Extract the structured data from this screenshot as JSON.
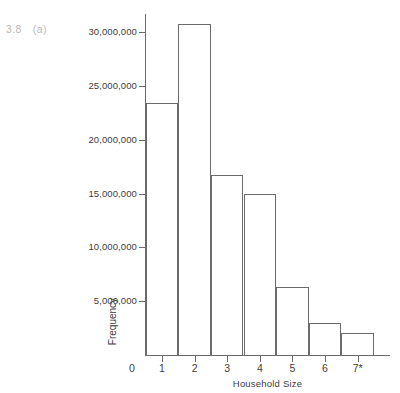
{
  "figure": {
    "number": "3.8",
    "part": "(a)",
    "top_bleed_text": ""
  },
  "chart_data": {
    "type": "bar",
    "title": "",
    "subtitle": "",
    "xlabel": "Household Size",
    "ylabel": "Frequency",
    "categories": [
      "1",
      "2",
      "3",
      "4",
      "5",
      "6",
      "7*"
    ],
    "values": [
      23400000,
      30700000,
      16700000,
      15000000,
      6300000,
      3000000,
      2000000
    ],
    "x_tick_labels": [
      "0",
      "1",
      "2",
      "3",
      "4",
      "5",
      "6",
      "7*"
    ],
    "y_tick_labels": [
      "5,000,000",
      "10,000,000",
      "15,000,000",
      "20,000,000",
      "25,000,000",
      "30,000,000"
    ],
    "y_tick_values": [
      5000000,
      10000000,
      15000000,
      20000000,
      25000000,
      30000000
    ],
    "ylim": [
      0,
      31600000
    ],
    "xlim": [
      0,
      7.5
    ],
    "grid": false,
    "legend": false,
    "bar_style": "outline",
    "colors": {
      "stroke": "#6b6b6b",
      "fill": "none",
      "background": "#ffffff",
      "text": "#3d3d3d",
      "figure_label": "#b9b9b9"
    }
  }
}
